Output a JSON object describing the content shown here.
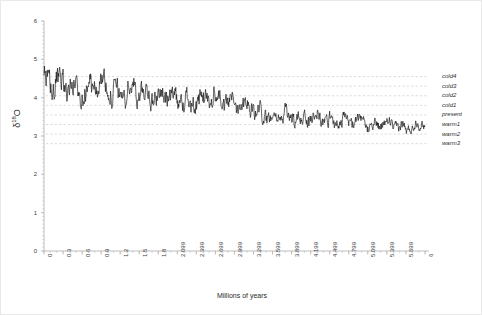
{
  "figure": {
    "background_color": "#ffffff",
    "border_color": "#e9e9e9",
    "axis_color": "#bdbdbd",
    "gridline_color": "#cccccc",
    "series_color": "#111111"
  },
  "axes": {
    "y_title_main": "δ",
    "y_title_sup": "18",
    "y_title_tail": "O",
    "x_title": "Millions of years"
  },
  "chart_data": {
    "type": "line",
    "title": "",
    "xlabel": "Millions of years",
    "ylabel": "δ18O",
    "xlim": [
      0,
      6
    ],
    "ylim": [
      0,
      6
    ],
    "grid": true,
    "legend_position": "right-outside",
    "y_ticks": [
      "0",
      "1",
      "2",
      "3",
      "4",
      "5",
      "6"
    ],
    "y_tick_values": [
      0,
      1,
      2,
      3,
      4,
      5,
      6
    ],
    "x_ticks": [
      "0",
      "0.3",
      "0.6",
      "0.9",
      "1.2",
      "1.5",
      "1.8",
      "2.099",
      "2.399",
      "2.699",
      "2.999",
      "3.299",
      "3.599",
      "3.899",
      "4.199",
      "4.499",
      "4.799",
      "5.099",
      "5.399",
      "5.699",
      "6"
    ],
    "x_tick_values": [
      0,
      0.3,
      0.6,
      0.9,
      1.2,
      1.5,
      1.8,
      2.099,
      2.399,
      2.699,
      2.999,
      3.299,
      3.599,
      3.899,
      4.199,
      4.499,
      4.799,
      5.099,
      5.399,
      5.699,
      6
    ],
    "reference_lines": [
      {
        "label": "cold4",
        "value": 4.55
      },
      {
        "label": "cold3",
        "value": 4.3
      },
      {
        "label": "cold2",
        "value": 4.05
      },
      {
        "label": "cold1",
        "value": 3.8
      },
      {
        "label": "present",
        "value": 3.55
      },
      {
        "label": "warm1",
        "value": 3.3
      },
      {
        "label": "warm2",
        "value": 3.05
      },
      {
        "label": "warm3",
        "value": 2.8
      }
    ],
    "series": [
      {
        "name": "d18O benthic stack",
        "color": "#111111",
        "trend_anchors_x": [
          0.0,
          0.3,
          0.6,
          0.9,
          1.2,
          1.5,
          1.8,
          2.1,
          2.4,
          2.7,
          3.0,
          3.3,
          3.6,
          3.9,
          4.2,
          4.5,
          4.8,
          5.1,
          5.4,
          5.7,
          6.0
        ],
        "trend_anchors_y": [
          4.45,
          4.28,
          4.22,
          4.3,
          4.16,
          4.12,
          4.08,
          3.96,
          3.9,
          3.96,
          3.92,
          3.68,
          3.52,
          3.5,
          3.46,
          3.42,
          3.36,
          3.34,
          3.3,
          3.22,
          3.3
        ],
        "noise_amplitude_start": 0.58,
        "noise_amplitude_end": 0.22,
        "sample_count": 900,
        "y_min_observed": 2.45,
        "y_max_observed": 5.15
      }
    ]
  }
}
